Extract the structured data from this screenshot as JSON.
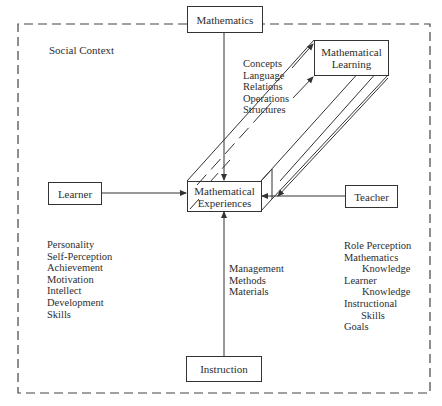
{
  "diagram": {
    "outer_label": "Social Context",
    "nodes": {
      "mathematics": "Mathematics",
      "learning_line1": "Mathematical",
      "learning_line2": "Learning",
      "experiences_line1": "Mathematical",
      "experiences_line2": "Experiences",
      "learner": "Learner",
      "teacher": "Teacher",
      "instruction": "Instruction"
    },
    "mathematics_aspects": [
      "Concepts",
      "Language",
      "Relations",
      "Operations",
      "Structures"
    ],
    "learner_attributes": [
      "Personality",
      "Self-Perception",
      "Achievement",
      "Motivation",
      "Intellect",
      "Development",
      "Skills"
    ],
    "instruction_aspects": [
      "Management",
      "Methods",
      "Materials"
    ],
    "teacher_attributes": [
      {
        "text": "Role Perception",
        "indent": false
      },
      {
        "text": "Mathematics",
        "indent": false
      },
      {
        "text": "Knowledge",
        "indent": true
      },
      {
        "text": "Learner",
        "indent": false
      },
      {
        "text": "Knowledge",
        "indent": true
      },
      {
        "text": "Instructional",
        "indent": false
      },
      {
        "text": "Skills",
        "indent": true
      },
      {
        "text": "Goals",
        "indent": false
      }
    ],
    "colors": {
      "line": "#333333",
      "text": "#2e2e2e",
      "background": "#ffffff"
    }
  }
}
